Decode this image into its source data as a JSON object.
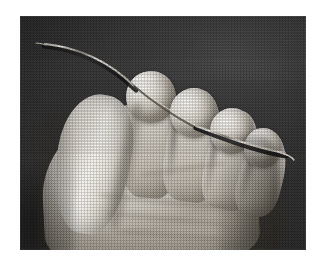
{
  "image": {
    "kind": "photograph",
    "subject": "A human hand, palm toward the camera with fingers curled, gripping a long thin curved needle or wire between the fingertips",
    "medium": "black and white halftone print",
    "caption": "",
    "orientation": "landscape",
    "page_background": "#ffffff",
    "plate": {
      "x": 20,
      "y": 16,
      "width": 286,
      "height": 234,
      "background_color": "#3b3b3b",
      "backdrop_description": "dark mottled grey studio backdrop"
    },
    "elements": [
      {
        "name": "hand",
        "label": "Curled human hand"
      },
      {
        "name": "thumb",
        "label": "Thumb"
      },
      {
        "name": "index-fingertip",
        "label": "Index fingertip"
      },
      {
        "name": "middle-fingertip",
        "label": "Middle fingertip"
      },
      {
        "name": "ring-fingertip",
        "label": "Ring fingertip"
      },
      {
        "name": "little-fingertip",
        "label": "Little fingertip"
      },
      {
        "name": "needle",
        "label": "Long thin curved needle held across the fingertips"
      }
    ],
    "colors": {
      "skin_highlight": "#fbfaf8",
      "skin_midtone": "#ded9d1",
      "skin_shadow": "#a49d92",
      "backdrop_dark": "#2f2f2f",
      "backdrop_light": "#4a4a4a",
      "needle_highlight": "#e9e6df",
      "needle_shadow": "#1d1d1d",
      "paper": "#ffffff"
    }
  }
}
